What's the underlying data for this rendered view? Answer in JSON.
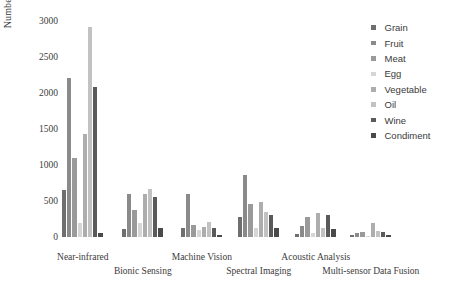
{
  "chart_data": {
    "type": "bar",
    "title": "",
    "subtitle": "",
    "xlabel": "",
    "ylabel": "Number of research papers",
    "ylim": [
      0,
      3000
    ],
    "ytick_values": [
      0,
      500,
      1000,
      1500,
      2000,
      2500,
      3000
    ],
    "ytick_labels": [
      "0",
      "500",
      "1000",
      "1500",
      "2000",
      "2500",
      "3000"
    ],
    "grid": false,
    "legend_position": "right",
    "categories": [
      "Near-infrared",
      "Bionic Sensing",
      "Machine Vision",
      "Spectral Imaging",
      "Acoustic Analysis",
      "Multi-sensor Data Fusion"
    ],
    "series": [
      {
        "name": "Grain",
        "color": "#6f6f6f",
        "values": [
          650,
          110,
          130,
          280,
          40,
          30
        ]
      },
      {
        "name": "Fruit",
        "color": "#8a8a8a",
        "values": [
          2210,
          600,
          600,
          860,
          150,
          60
        ]
      },
      {
        "name": "Meat",
        "color": "#9a9a9a",
        "values": [
          1100,
          380,
          170,
          460,
          280,
          70
        ]
      },
      {
        "name": "Egg",
        "color": "#d6d6d6",
        "values": [
          200,
          190,
          100,
          130,
          60,
          20
        ]
      },
      {
        "name": "Vegetable",
        "color": "#adadad",
        "values": [
          1430,
          600,
          140,
          490,
          340,
          200
        ]
      },
      {
        "name": "Oil",
        "color": "#c2c2c2",
        "values": [
          2910,
          660,
          210,
          350,
          130,
          90
        ]
      },
      {
        "name": "Wine",
        "color": "#5a5a5a",
        "values": [
          2080,
          560,
          120,
          310,
          310,
          70
        ]
      },
      {
        "name": "Condiment",
        "color": "#4a4a4a",
        "values": [
          60,
          120,
          30,
          130,
          110,
          30
        ]
      }
    ]
  },
  "legend": {
    "items": [
      {
        "label": "Grain"
      },
      {
        "label": "Fruit"
      },
      {
        "label": "Meat"
      },
      {
        "label": "Egg"
      },
      {
        "label": "Vegetable"
      },
      {
        "label": "Oil"
      },
      {
        "label": "Wine"
      },
      {
        "label": "Condiment"
      }
    ]
  }
}
